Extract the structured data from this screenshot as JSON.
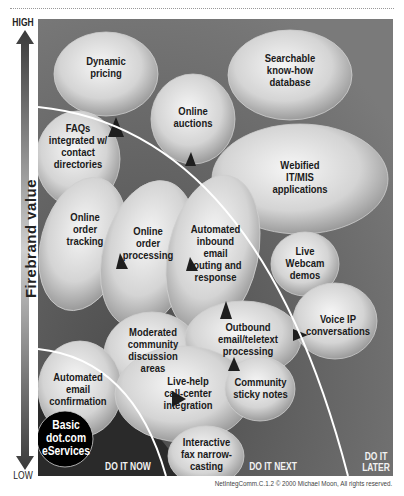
{
  "axis": {
    "high_label": "HIGH",
    "low_label": "LOW",
    "y_title": "Firebrand value"
  },
  "zones": {
    "now": "DO IT NOW",
    "next": "DO IT NEXT",
    "later": "DO IT\nLATER"
  },
  "bubbles": [
    {
      "id": "dynamic-pricing",
      "label": "Dynamic\npricing"
    },
    {
      "id": "searchable-know-how-database",
      "label": "Searchable\nknow-how\ndatabase"
    },
    {
      "id": "online-auctions",
      "label": "Online\nauctions"
    },
    {
      "id": "faqs-integrated",
      "label": "FAQs\nintegrated w/\ncontact\ndirectories"
    },
    {
      "id": "webified-it-mis",
      "label": "Webified\nIT/MIS\napplications"
    },
    {
      "id": "online-order-tracking",
      "label": "Online\norder\ntracking"
    },
    {
      "id": "online-order-processing",
      "label": "Online\norder\nprocessing"
    },
    {
      "id": "automated-inbound-email",
      "label": "Automated\ninbound\nemail\nrouting and\nresponse"
    },
    {
      "id": "live-webcam-demos",
      "label": "Live\nWebcam\ndemos"
    },
    {
      "id": "moderated-community",
      "label": "Moderated\ncommunity\ndiscussion\nareas"
    },
    {
      "id": "outbound-email-teletext",
      "label": "Outbound\nemail/teletext\nprocessing"
    },
    {
      "id": "voice-ip",
      "label": "Voice IP\nconversations"
    },
    {
      "id": "automated-email-confirmation",
      "label": "Automated\nemail\nconfirmation"
    },
    {
      "id": "live-help-call-center",
      "label": "Live-help\ncall-center\nintegration"
    },
    {
      "id": "community-sticky-notes",
      "label": "Community\nsticky notes"
    },
    {
      "id": "basic-dotcom-eservices",
      "label": "Basic\ndot.com\neServices"
    },
    {
      "id": "interactive-fax",
      "label": "Interactive\nfax narrow-\ncasting"
    }
  ],
  "footer": "NetIntegComm.C.1.2 © 2000 Michael Moon, All rights reserved.",
  "colors": {
    "background": "#6e6e6e",
    "bubble_light": "#f4f4f4",
    "bubble_dark": "#9a9a9a",
    "basic_bubble": "#000000",
    "curve": "#ffffff"
  }
}
